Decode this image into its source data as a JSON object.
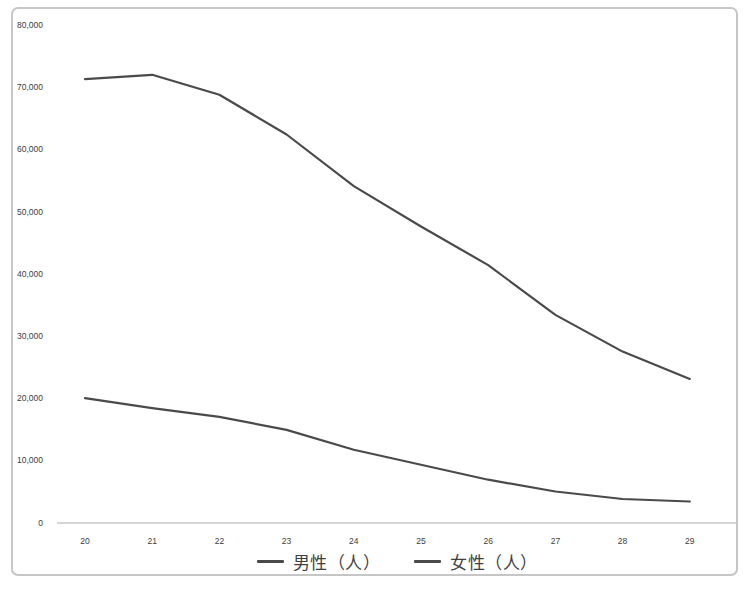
{
  "chart_data": {
    "type": "line",
    "x": [
      20,
      21,
      22,
      23,
      24,
      25,
      26,
      27,
      28,
      29
    ],
    "x_tick_labels": [
      "20",
      "21",
      "22",
      "23",
      "24",
      "25",
      "26",
      "27",
      "28",
      "29"
    ],
    "series": [
      {
        "name": "男性（人）",
        "color": "#4a4a4a",
        "values": [
          71300,
          72000,
          68800,
          62400,
          54100,
          47600,
          41400,
          33400,
          27500,
          23100
        ]
      },
      {
        "name": "女性（人）",
        "color": "#4a4a4a",
        "values": [
          20000,
          18400,
          17000,
          14900,
          11700,
          9300,
          6900,
          5000,
          3800,
          3400
        ]
      }
    ],
    "title": "",
    "xlabel": "",
    "ylabel": "",
    "ylim": [
      0,
      80000
    ],
    "ytick_step": 10000,
    "y_tick_labels": [
      "0",
      "10,000",
      "20,000",
      "30,000",
      "40,000",
      "50,000",
      "60,000",
      "70,000",
      "80,000"
    ],
    "grid": false,
    "legend_position": "bottom-center"
  },
  "colors": {
    "line": "#4a4a4a",
    "axis_line": "#c9c9c9",
    "tick_text": "#3d3d3d",
    "frame_border": "#c6c6c6",
    "background": "#ffffff"
  }
}
